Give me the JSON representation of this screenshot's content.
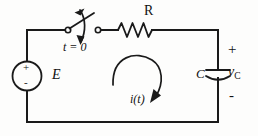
{
  "diagram": {
    "type": "electrical-schematic",
    "background_color": "#fdfdfc",
    "line_color": "#1a1a1a"
  },
  "labels": {
    "resistor": "R",
    "switch_time": "t = 0",
    "source": "E",
    "capacitor": "C",
    "capacitor_voltage_base": "v",
    "capacitor_voltage_sub": "C",
    "current": "i(t)",
    "polarity_plus": "+",
    "polarity_minus": "-",
    "source_plus": "+",
    "source_minus": "-"
  },
  "components": {
    "voltage_source": {
      "name": "E",
      "shape": "circle",
      "center_x": 27,
      "center_y": 76,
      "radius": 14.5,
      "polarity_top": "+",
      "polarity_bottom": "-"
    },
    "resistor": {
      "name": "R",
      "shape": "zigzag",
      "x_start": 118,
      "x_end": 152,
      "y": 30,
      "peaks": 3
    },
    "switch": {
      "name": "t = 0",
      "left_terminal_x": 68,
      "right_terminal_x": 98,
      "y": 30,
      "state": "open",
      "blade_angle_deg": -38
    },
    "capacitor": {
      "name": "C",
      "x": 218,
      "top_plate_y": 70,
      "bottom_plate_y": 77,
      "plate_half_width": 12,
      "bottom_plate_curved": true
    },
    "current_arrow": {
      "name": "i(t)",
      "direction": "clockwise",
      "label": "i(t)"
    }
  },
  "frame": {
    "left_x": 27,
    "right_x": 218,
    "top_y": 30,
    "bottom_y": 122
  }
}
